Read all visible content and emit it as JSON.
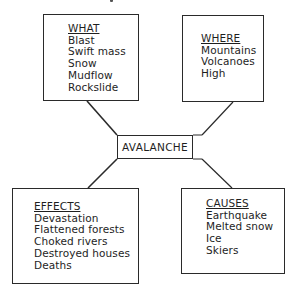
{
  "diagram": {
    "center": {
      "label": "AVALANCHE"
    },
    "nodes": {
      "what": {
        "heading": "WHAT",
        "items": [
          "Blast",
          "Swift mass",
          "Snow",
          "Mudflow",
          "Rockslide"
        ]
      },
      "where": {
        "heading": "WHERE",
        "items": [
          "Mountains",
          "Volcanoes",
          "High"
        ]
      },
      "effects": {
        "heading": "EFFECTS",
        "items": [
          "Devastation",
          "Flattened forests",
          "Choked rivers",
          "Destroyed houses",
          "Deaths"
        ]
      },
      "causes": {
        "heading": "CAUSES",
        "items": [
          "Earthquake",
          "Melted snow",
          "Ice",
          "Skiers"
        ]
      }
    },
    "colors": {
      "line": "#2a2a2a",
      "text": "#1e1e1e",
      "background": "#ffffff"
    }
  }
}
